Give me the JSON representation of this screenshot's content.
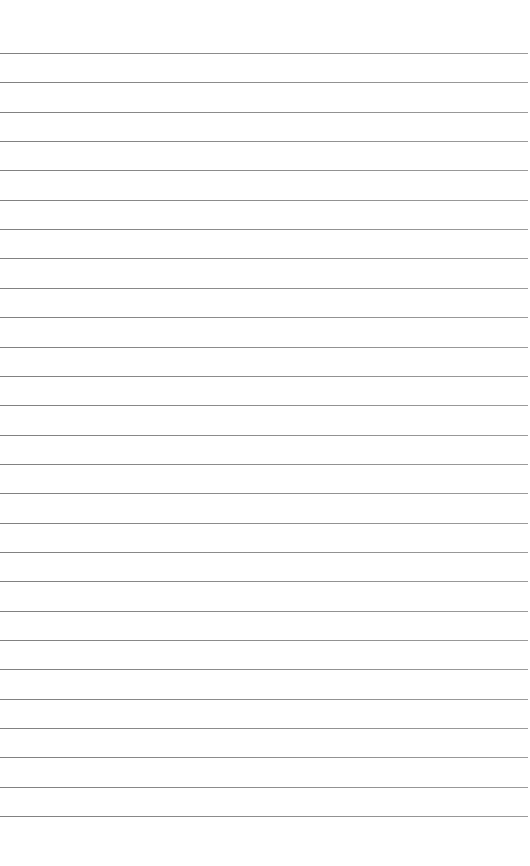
{
  "page": {
    "type": "lined-paper",
    "background_color": "#ffffff",
    "line_color": "#757575",
    "first_line_y": 53,
    "line_spacing": 29.35,
    "line_count": 27,
    "text_content": []
  }
}
